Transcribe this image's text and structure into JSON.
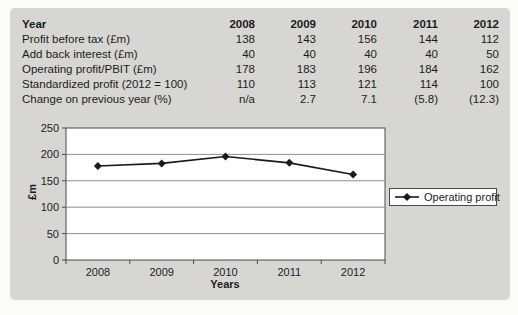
{
  "figure": {
    "background_color": "#d7d6d2",
    "text_color": "#1c1c1c"
  },
  "table": {
    "header": {
      "label": "Year",
      "years": [
        "2008",
        "2009",
        "2010",
        "2011",
        "2012"
      ]
    },
    "rows": [
      {
        "label": "Profit before tax (£m)",
        "values": [
          "138",
          "143",
          "156",
          "144",
          "112"
        ]
      },
      {
        "label": "Add back interest (£m)",
        "values": [
          "40",
          "40",
          "40",
          "40",
          "50"
        ]
      },
      {
        "label": "Operating profit/PBIT (£m)",
        "values": [
          "178",
          "183",
          "196",
          "184",
          "162"
        ]
      },
      {
        "label": "Standardized profit (2012 = 100)",
        "values": [
          "110",
          "113",
          "121",
          "114",
          "100"
        ]
      },
      {
        "label": "Change on previous year (%)",
        "values": [
          "n/a",
          "2.7",
          "7.1",
          "(5.8)",
          "(12.3)"
        ]
      }
    ]
  },
  "chart_data": {
    "type": "line",
    "categories": [
      "2008",
      "2009",
      "2010",
      "2011",
      "2012"
    ],
    "series": [
      {
        "name": "Operating profit",
        "values": [
          178,
          183,
          196,
          184,
          162
        ]
      }
    ],
    "title": "",
    "xlabel": "Years",
    "ylabel": "£m",
    "ylim": [
      0,
      250
    ],
    "ytick_step": 50,
    "grid": true,
    "legend_position": "right",
    "marker": "diamond",
    "line_color": "#1a1a1a",
    "gridline_color": "#8d8d8d",
    "axis_color": "#4a4a4a",
    "plot_background": "#ffffff"
  }
}
